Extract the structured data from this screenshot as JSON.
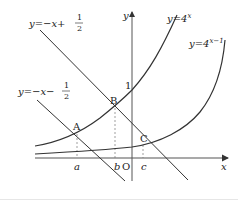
{
  "figure": {
    "colors": {
      "curve": "#333333",
      "axis": "#555555",
      "guide": "#777777",
      "background": "#ffffff"
    },
    "axes": {
      "x_label": "x",
      "y_label": "y",
      "origin_label": "O",
      "y_tick_label": "1"
    },
    "curves": [
      {
        "id": "exp4x",
        "label_prefix": "y=4",
        "label_exp": "x"
      },
      {
        "id": "exp4x_minus1",
        "label_prefix": "y=4",
        "label_exp": "x−1"
      }
    ],
    "lines": [
      {
        "id": "line_plus",
        "label_prefix": "y=−x+",
        "frac_num": "1",
        "frac_den": "2"
      },
      {
        "id": "line_minus",
        "label_prefix": "y=−x−",
        "frac_num": "1",
        "frac_den": "2"
      }
    ],
    "points": [
      {
        "name": "A",
        "x_label": "a"
      },
      {
        "name": "B",
        "x_label": "b"
      },
      {
        "name": "C",
        "x_label": "c"
      }
    ]
  }
}
